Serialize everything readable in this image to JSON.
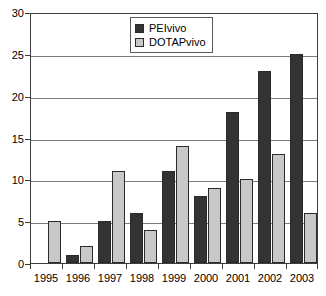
{
  "chart_data": {
    "type": "bar",
    "title": "",
    "subtitle": "",
    "xlabel": "",
    "ylabel": "",
    "categories": [
      "1995",
      "1996",
      "1997",
      "1998",
      "1999",
      "2000",
      "2001",
      "2002",
      "2003"
    ],
    "series": [
      {
        "name": "PEIvivo",
        "color": "#333333",
        "values": [
          0,
          1,
          5,
          6,
          11,
          8,
          18,
          23,
          25
        ]
      },
      {
        "name": "DOTAPvivo",
        "color": "#c8c8c8",
        "values": [
          5,
          2,
          11,
          4,
          14,
          9,
          10,
          13,
          6
        ]
      }
    ],
    "ylim": [
      0,
      30
    ],
    "yticks": [
      0,
      5,
      10,
      15,
      20,
      25,
      30
    ],
    "ytick_labels": [
      "0",
      "5",
      "10",
      "15",
      "20",
      "25",
      "30"
    ],
    "grid": "horizontal",
    "legend_position": "top-center",
    "legend_entries": [
      "PEIvivo",
      "DOTAPvivo"
    ]
  },
  "legend": {
    "items": [
      {
        "label": "PEIvivo",
        "swatch": "legend-swatch-peivivo"
      },
      {
        "label": "DOTAPvivo",
        "swatch": "legend-swatch-dotapvivo"
      }
    ]
  }
}
